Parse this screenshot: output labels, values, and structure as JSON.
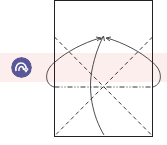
{
  "diagram": {
    "type": "origami-fold-step",
    "step_icon": "turn-over-icon",
    "colors": {
      "band": "#fbeeec",
      "icon_bg": "#5a5798",
      "icon_fg": "#ffffff",
      "line": "#222222"
    },
    "lines": {
      "outline": "solid",
      "diagonals": "dashed (valley fold)",
      "horizontal": "dash-dot (mountain fold)"
    }
  }
}
